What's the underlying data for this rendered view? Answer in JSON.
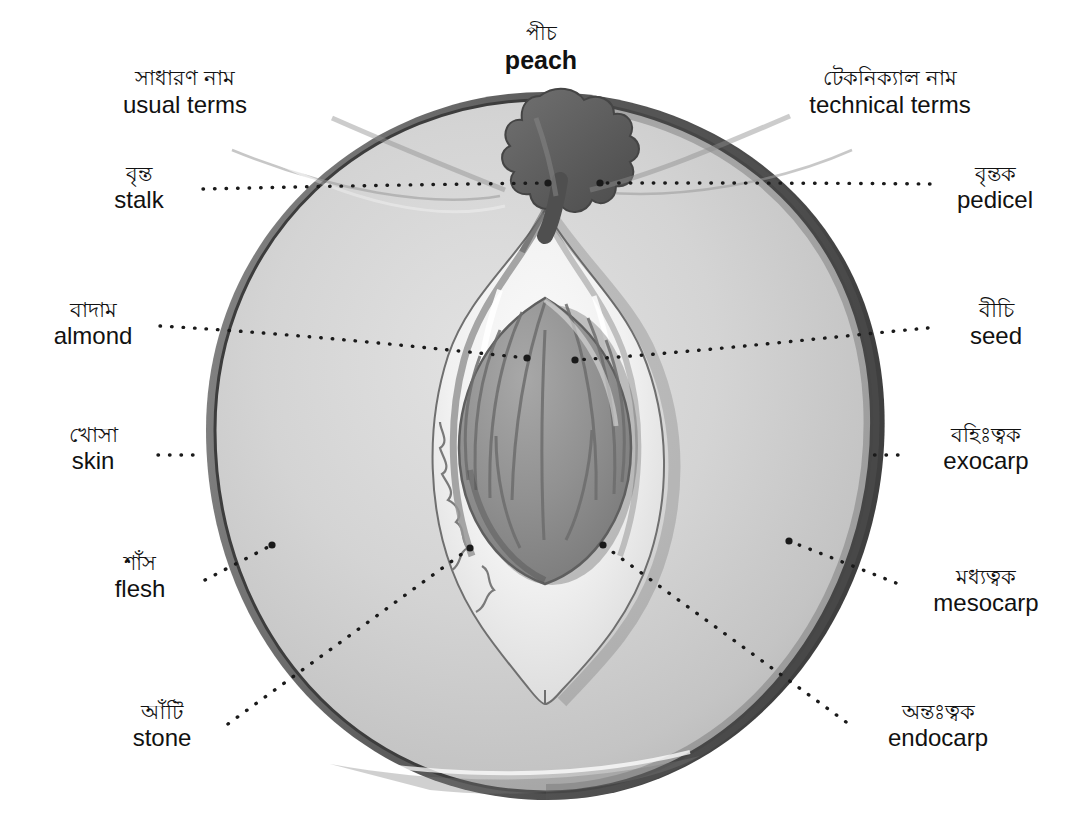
{
  "title": {
    "bn": "পীচ",
    "en": "peach"
  },
  "headers": {
    "left": {
      "bn": "সাধারণ নাম",
      "en": "usual terms"
    },
    "right": {
      "bn": "টেকনিক্যাল নাম",
      "en": "technical terms"
    }
  },
  "labels_left": [
    {
      "id": "stalk",
      "bn": "বৃন্ত",
      "en": "stalk"
    },
    {
      "id": "almond",
      "bn": "বাদাম",
      "en": "almond"
    },
    {
      "id": "skin",
      "bn": "খোসা",
      "en": "skin"
    },
    {
      "id": "flesh",
      "bn": "শাঁস",
      "en": "flesh"
    },
    {
      "id": "stone",
      "bn": "আঁটি",
      "en": "stone"
    }
  ],
  "labels_right": [
    {
      "id": "pedicel",
      "bn": "বৃন্তক",
      "en": "pedicel"
    },
    {
      "id": "seed",
      "bn": "বীচি",
      "en": "seed"
    },
    {
      "id": "exocarp",
      "bn": "বহিঃত্বক",
      "en": "exocarp"
    },
    {
      "id": "mesocarp",
      "bn": "মধ্যত্বক",
      "en": "mesocarp"
    },
    {
      "id": "endocarp",
      "bn": "অন্তঃত্বক",
      "en": "endocarp"
    }
  ],
  "colors": {
    "background": "#ffffff",
    "text": "#111111",
    "skin_outline": "#4a4a4a",
    "flesh_light": "#d8d8d8",
    "flesh_mid": "#c6c6c6",
    "pit_white": "#f6f6f6",
    "seed_gray": "#8f8f8f",
    "seed_stripe": "#6e6e6e",
    "stem_dark": "#5e5e5e",
    "leader_dots": "#1a1a1a"
  },
  "diagram": {
    "type": "anatomical-cross-section",
    "parts": [
      "stalk/pedicel",
      "almond/seed",
      "skin/exocarp",
      "flesh/mesocarp",
      "stone/endocarp"
    ]
  }
}
